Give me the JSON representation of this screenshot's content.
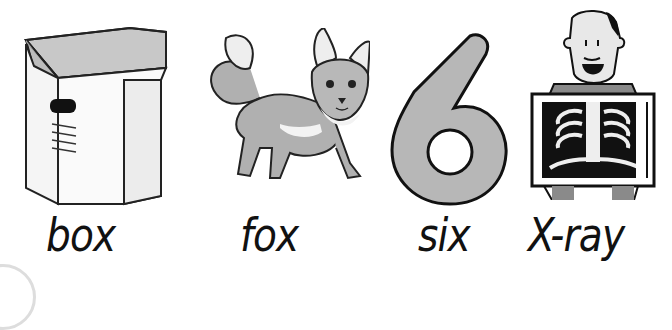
{
  "items": [
    {
      "word": "box",
      "picture": "cardboard-box"
    },
    {
      "word": "fox",
      "picture": "fox"
    },
    {
      "word": "six",
      "picture": "number-six"
    },
    {
      "word": "X-ray",
      "picture": "man-holding-x-ray"
    }
  ],
  "colors": {
    "background": "#ffffff",
    "ink": "#111111",
    "fill_gray": "#b3b3b3",
    "light_gray": "#e6e6e6"
  }
}
